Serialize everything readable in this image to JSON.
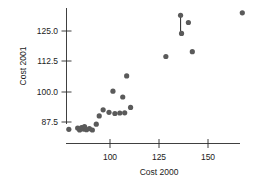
{
  "chart_data": {
    "type": "scatter",
    "title": "",
    "xlabel": "Cost 2000",
    "ylabel": "Cost 2001",
    "xticks": [
      100,
      125,
      150
    ],
    "yticks": [
      87.5,
      100.0,
      112.5,
      125.0
    ],
    "xticklabels": [
      "100",
      "125",
      "150"
    ],
    "yticklabels": [
      "87.5",
      "100.0",
      "112.5",
      "125.0"
    ],
    "xlim": [
      76,
      172
    ],
    "ylim": [
      83,
      134
    ],
    "grid": false,
    "legend": null,
    "marker_color": "#5a5a5a",
    "axis_color": "#2a2a2a",
    "points": [
      {
        "x": 79.0,
        "y": 84.5
      },
      {
        "x": 83.5,
        "y": 85.0
      },
      {
        "x": 84.5,
        "y": 84.2
      },
      {
        "x": 85.5,
        "y": 85.2
      },
      {
        "x": 86.5,
        "y": 84.6
      },
      {
        "x": 87.0,
        "y": 85.6
      },
      {
        "x": 88.0,
        "y": 84.3
      },
      {
        "x": 89.5,
        "y": 84.8
      },
      {
        "x": 91.0,
        "y": 84.2
      },
      {
        "x": 93.0,
        "y": 86.6
      },
      {
        "x": 94.5,
        "y": 90.0
      },
      {
        "x": 96.5,
        "y": 92.5
      },
      {
        "x": 99.5,
        "y": 91.5
      },
      {
        "x": 101.5,
        "y": 100.2
      },
      {
        "x": 102.5,
        "y": 91.0
      },
      {
        "x": 105.0,
        "y": 91.2
      },
      {
        "x": 106.5,
        "y": 97.8
      },
      {
        "x": 107.5,
        "y": 91.3
      },
      {
        "x": 108.5,
        "y": 106.5
      },
      {
        "x": 110.5,
        "y": 93.5
      },
      {
        "x": 128.5,
        "y": 114.5
      },
      {
        "x": 136.0,
        "y": 131.5
      },
      {
        "x": 136.5,
        "y": 124.0
      },
      {
        "x": 140.0,
        "y": 128.5
      },
      {
        "x": 142.0,
        "y": 116.5
      },
      {
        "x": 167.5,
        "y": 132.5
      }
    ],
    "connector": {
      "x": 136.0,
      "y_top": 131.5,
      "y_bottom": 124.8,
      "description": "vertical line segment below top marker"
    }
  }
}
